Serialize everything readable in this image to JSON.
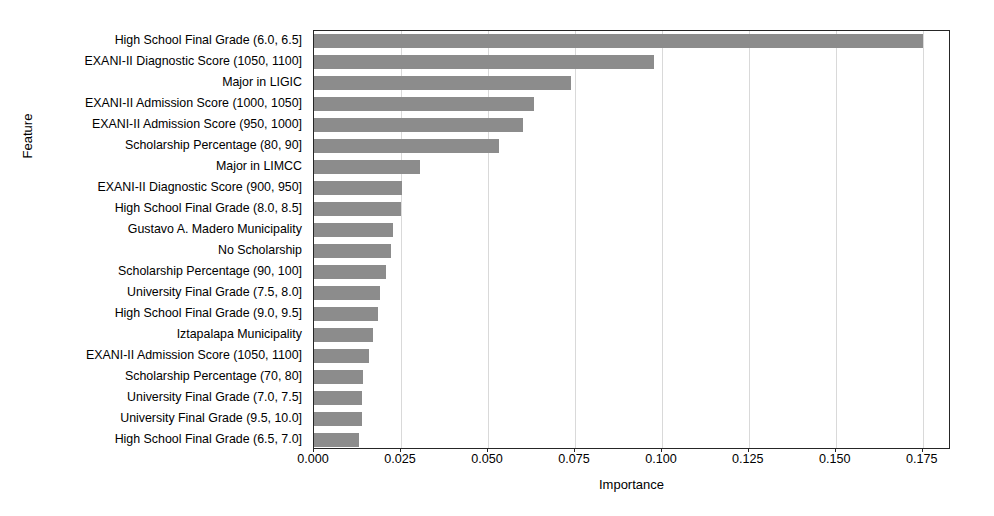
{
  "chart_data": {
    "type": "bar",
    "orientation": "horizontal",
    "title": "",
    "xlabel": "Importance",
    "ylabel": "Feature",
    "xlim": [
      0.0,
      0.1831
    ],
    "xticks": [
      0.0,
      0.025,
      0.05,
      0.075,
      0.1,
      0.125,
      0.15,
      0.175
    ],
    "xtick_labels": [
      "0.000",
      "0.025",
      "0.050",
      "0.075",
      "0.100",
      "0.125",
      "0.150",
      "0.175"
    ],
    "grid": "vertical",
    "legend": null,
    "bar_color": "#8c8c8c",
    "axis_color": "#262626",
    "grid_color": "#d9d9d9",
    "categories": [
      "High School Final Grade (6.0, 6.5]",
      "EXANI-II Diagnostic Score (1050, 1100]",
      "Major in LIGIC",
      "EXANI-II Admission Score (1000, 1050]",
      "EXANI-II Admission Score (950, 1000]",
      "Scholarship Percentage (80, 90]",
      "Major in LIMCC",
      "EXANI-II Diagnostic Score (900, 950]",
      "High School Final Grade (8.0, 8.5]",
      "Gustavo A. Madero Municipality",
      "No Scholarship",
      "Scholarship Percentage (90, 100]",
      "University Final Grade (7.5, 8.0]",
      "High School Final Grade (9.0, 9.5]",
      "Iztapalapa Municipality",
      "EXANI-II Admission Score (1050, 1100]",
      "Scholarship Percentage (70, 80]",
      "University Final Grade (7.0, 7.5]",
      "University Final Grade (9.5, 10.0]",
      "High School Final Grade (6.5, 7.0]"
    ],
    "values": [
      0.1751,
      0.0977,
      0.0738,
      0.0632,
      0.06,
      0.0532,
      0.0305,
      0.0253,
      0.025,
      0.0227,
      0.0221,
      0.0207,
      0.019,
      0.0184,
      0.0169,
      0.0158,
      0.0141,
      0.0138,
      0.0137,
      0.0128
    ]
  }
}
